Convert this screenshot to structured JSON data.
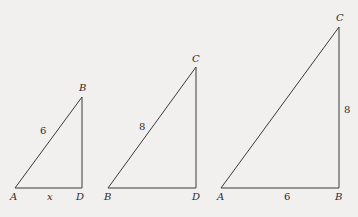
{
  "diagram": {
    "background": "#f1f0ee",
    "line_color": "#3a3a3a",
    "triangles": [
      {
        "id": "triangle-ABD",
        "vertices": {
          "A": {
            "x": 15,
            "y": 188,
            "label": "A",
            "lx": 10,
            "ly": 200
          },
          "B": {
            "x": 82,
            "y": 97,
            "label": "B",
            "lx": 79,
            "ly": 91
          },
          "D": {
            "x": 82,
            "y": 188,
            "label": "D",
            "lx": 76,
            "ly": 200
          }
        },
        "edge_labels": [
          {
            "text": "6",
            "x": 40,
            "y": 134,
            "italic": false
          },
          {
            "text": "x",
            "x": 47,
            "y": 200,
            "italic": true
          }
        ]
      },
      {
        "id": "triangle-BCD",
        "vertices": {
          "B": {
            "x": 108,
            "y": 188,
            "label": "B",
            "lx": 104,
            "ly": 200
          },
          "C": {
            "x": 196,
            "y": 67,
            "label": "C",
            "lx": 192,
            "ly": 62
          },
          "D": {
            "x": 196,
            "y": 188,
            "label": "D",
            "lx": 192,
            "ly": 200
          }
        },
        "edge_labels": [
          {
            "text": "8",
            "x": 139,
            "y": 130,
            "italic": false
          }
        ]
      },
      {
        "id": "triangle-ABC",
        "vertices": {
          "A": {
            "x": 221,
            "y": 188,
            "label": "A",
            "lx": 217,
            "ly": 200
          },
          "B": {
            "x": 339,
            "y": 188,
            "label": "B",
            "lx": 335,
            "ly": 200
          },
          "C": {
            "x": 339,
            "y": 27,
            "label": "C",
            "lx": 336,
            "ly": 21
          }
        },
        "edge_labels": [
          {
            "text": "8",
            "x": 344,
            "y": 113,
            "italic": false
          },
          {
            "text": "6",
            "x": 284,
            "y": 200,
            "italic": false
          }
        ]
      }
    ]
  }
}
